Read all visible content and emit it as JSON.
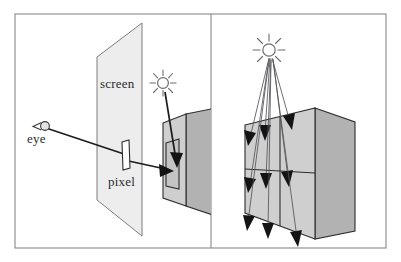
{
  "figure": {
    "background_color": "#ffffff",
    "frame_color": "#8e8e8e",
    "panels": [
      {
        "id": "left-panel",
        "caption": "Eye ray traced through a screen pixel to a lit surface point",
        "labels": {
          "screen": "screen",
          "pixel": "pixel",
          "eye": "eye"
        },
        "elements": [
          "eye-icon",
          "screen-plane",
          "pixel-rect",
          "view-ray",
          "sun-icon",
          "light-ray",
          "box-object"
        ]
      },
      {
        "id": "right-panel",
        "caption": "Many light rays emitted from the sun striking the object surface patches",
        "labels": {},
        "elements": [
          "sun-icon",
          "light-ray-bundle",
          "box-object",
          "surface-patch-grid"
        ],
        "ray_count": 9
      }
    ],
    "colors": {
      "screen_fill": "#ededed",
      "box_left_face": "#cfcfcf",
      "box_right_face": "#b2b2b2",
      "box_top_face": "#dedede",
      "ray_dark": "#1c1c1c",
      "ray_light": "#55555a",
      "text": "#2b2b2b"
    }
  }
}
